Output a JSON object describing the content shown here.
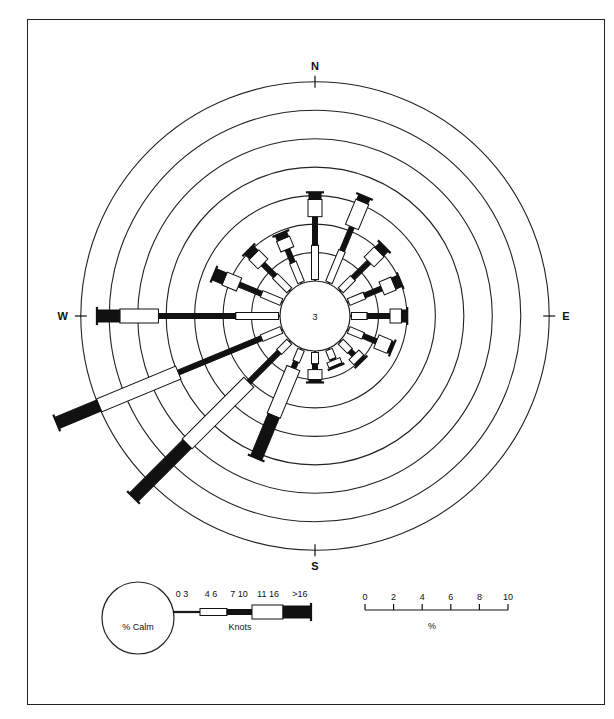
{
  "chart_data": {
    "type": "wind-rose",
    "title": "",
    "calm_percent": 3,
    "compass": {
      "north": "N",
      "east": "E",
      "south": "S",
      "west": "W"
    },
    "rings_percent_step": 2,
    "ring_count": 7,
    "speed_classes_knots": [
      "0 3",
      "4 6",
      "7 10",
      "11 16",
      ">16"
    ],
    "speed_unit_label": "Knots",
    "calm_label": "% Calm",
    "scale_bar": {
      "ticks": [
        "0",
        "2",
        "4",
        "6",
        "8",
        "10"
      ],
      "unit": "%"
    },
    "directions": [
      "N",
      "NNE",
      "NE",
      "ENE",
      "E",
      "ESE",
      "SE",
      "SSE",
      "S",
      "SSW",
      "SW",
      "WSW",
      "W",
      "WNW",
      "NW",
      "NNW"
    ],
    "series": [
      {
        "name": "0-3",
        "values": [
          0.1,
          0.1,
          0.1,
          0.1,
          0.1,
          0.1,
          0.1,
          0.1,
          0.1,
          0.1,
          0.1,
          0.1,
          0.1,
          0.1,
          0.1,
          0.1
        ]
      },
      {
        "name": "4-6",
        "values": [
          2.4,
          2.4,
          1.2,
          1.2,
          1.1,
          1.1,
          0.9,
          0.7,
          0.8,
          0.9,
          1.0,
          1.5,
          3.0,
          1.5,
          1.4,
          1.5
        ]
      },
      {
        "name": "7-10",
        "values": [
          2.0,
          1.8,
          1.6,
          1.3,
          1.6,
          1.0,
          0.4,
          0.1,
          0.4,
          0.5,
          3.0,
          6.3,
          5.4,
          1.7,
          1.2,
          1.0
        ]
      },
      {
        "name": "11-16",
        "values": [
          1.2,
          1.9,
          1.0,
          0.9,
          0.8,
          1.0,
          0.5,
          0.4,
          0.7,
          3.6,
          6.1,
          6.0,
          2.7,
          1.1,
          0.9,
          0.8
        ]
      },
      {
        "name": ">16",
        "values": [
          0.5,
          0.4,
          0.5,
          0.5,
          0.4,
          0.2,
          0.2,
          0.1,
          0.2,
          3.2,
          5.3,
          3.2,
          1.6,
          0.8,
          0.5,
          0.4
        ]
      }
    ]
  }
}
